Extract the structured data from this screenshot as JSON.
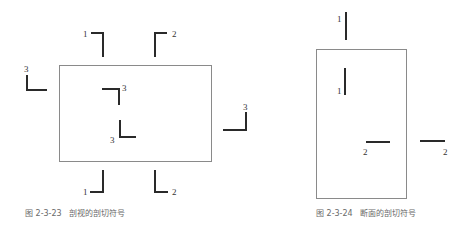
{
  "figures": [
    {
      "id": "fig-2-3-23",
      "caption": "图 2-3-23   剖视的剖切符号",
      "frame": {
        "x": 59,
        "y": 65,
        "w": 152,
        "h": 96
      },
      "symbols": [
        {
          "name": "cut-1-top",
          "label": "1",
          "path": "M91,33 L103,33 L103,57",
          "label_x": 83,
          "label_y": 37
        },
        {
          "name": "cut-2-top",
          "label": "2",
          "path": "M167,33 L155,33 L155,57",
          "label_x": 172,
          "label_y": 37
        },
        {
          "name": "cut-3-left",
          "label": "3",
          "path": "M27,75 L27,90 L47,90",
          "label_x": 24,
          "label_y": 72
        },
        {
          "name": "cut-3-inner-top",
          "label": "3",
          "path": "M102,89 L119,89 L119,105",
          "label_x": 122,
          "label_y": 91
        },
        {
          "name": "cut-3-inner-bottom",
          "label": "3",
          "path": "M120,120 L120,137 L136,137",
          "label_x": 110,
          "label_y": 143
        },
        {
          "name": "cut-3-right",
          "label": "3",
          "path": "M223,130 L246,130 L246,112",
          "label_x": 243,
          "label_y": 110
        },
        {
          "name": "cut-1-bottom",
          "label": "1",
          "path": "M103,170 L103,192 L90,192",
          "label_x": 83,
          "label_y": 195
        },
        {
          "name": "cut-2-bottom",
          "label": "2",
          "path": "M155,170 L155,192 L168,192",
          "label_x": 172,
          "label_y": 195
        }
      ],
      "caption_pos": {
        "x": 25,
        "y": 209
      }
    },
    {
      "id": "fig-2-3-24",
      "caption": "图 2-3-24   断面的剖切符号",
      "frame": {
        "x": 316,
        "y": 49,
        "w": 90,
        "h": 149
      },
      "symbols": [
        {
          "name": "section-1-top",
          "label": "1",
          "path": "M346,12 L346,40",
          "label_x": 337,
          "label_y": 22
        },
        {
          "name": "section-1-inner",
          "label": "1",
          "path": "M345,68 L345,95",
          "label_x": 337,
          "label_y": 94
        },
        {
          "name": "section-2-inner",
          "label": "2",
          "path": "M366,142 L390,142",
          "label_x": 363,
          "label_y": 155
        },
        {
          "name": "section-2-outer",
          "label": "2",
          "path": "M420,141 L445,141",
          "label_x": 443,
          "label_y": 155
        }
      ],
      "caption_pos": {
        "x": 316,
        "y": 209
      }
    }
  ]
}
